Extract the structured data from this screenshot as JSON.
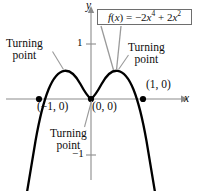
{
  "figure": {
    "background_color": "#ffffff",
    "curve_color": "#000000",
    "axis_color": "#8c8c8c",
    "leader_color": "#9a9a9a",
    "text_color": "#0d0d0d"
  },
  "formula": {
    "label": "f(x) = −2x⁴ + 2x²",
    "function_name": "f",
    "variable": "x",
    "expression": "−2x^4 + 2x^2"
  },
  "axes": {
    "x_label": "x",
    "y_label": "y",
    "x_ticks": [],
    "y_ticks": [
      {
        "label": "1",
        "value": 1
      },
      {
        "label": "−1",
        "value": -1
      }
    ]
  },
  "annotations": [
    {
      "name": "turning-point-left",
      "line1": "Turning",
      "line2": "point"
    },
    {
      "name": "turning-point-right",
      "line1": "Turning",
      "line2": "point"
    },
    {
      "name": "turning-point-bottom",
      "line1": "Turning",
      "line2": "point"
    }
  ],
  "points": [
    {
      "name": "x-intercept-negative-one",
      "label": "(−1, 0)",
      "x": -1,
      "y": 0
    },
    {
      "name": "origin-intercept",
      "label": "(0, 0)",
      "x": 0,
      "y": 0
    },
    {
      "name": "x-intercept-one",
      "label": "(1, 0)",
      "x": 1,
      "y": 0
    }
  ],
  "chart_data": {
    "type": "line",
    "title": "",
    "xlabel": "x",
    "ylabel": "y",
    "function": "f(x) = -2x^4 + 2x^2",
    "grid": false,
    "legend": "none",
    "xlim": [
      -1.23,
      1.23
    ],
    "ylim": [
      -1.78,
      0.85
    ],
    "x_ticks": [],
    "y_ticks": [
      1,
      -1
    ],
    "y_tick_labels": [
      "1",
      "-1"
    ],
    "roots": [
      -1,
      0,
      1
    ],
    "turning_points": [
      {
        "x": -0.7071,
        "y": 0.5,
        "type": "maximum"
      },
      {
        "x": 0,
        "y": 0,
        "type": "minimum"
      },
      {
        "x": 0.7071,
        "y": 0.5,
        "type": "maximum"
      }
    ],
    "x": [
      -1.23,
      -1.18,
      -1.13,
      -1.08,
      -1.03,
      -0.98,
      -0.93,
      -0.88,
      -0.83,
      -0.78,
      -0.73,
      -0.68,
      -0.63,
      -0.58,
      -0.53,
      -0.48,
      -0.43,
      -0.38,
      -0.33,
      -0.28,
      -0.23,
      -0.18,
      -0.13,
      -0.08,
      -0.03,
      0.03,
      0.08,
      0.13,
      0.18,
      0.23,
      0.28,
      0.33,
      0.38,
      0.43,
      0.48,
      0.53,
      0.58,
      0.63,
      0.68,
      0.73,
      0.78,
      0.83,
      0.88,
      0.93,
      0.98,
      1.03,
      1.08,
      1.13,
      1.18,
      1.23
    ],
    "y": [
      -1.55,
      -1.09,
      -0.71,
      -0.39,
      -0.13,
      0.07,
      0.23,
      0.33,
      0.4,
      0.44,
      0.5,
      0.49,
      0.48,
      0.45,
      0.4,
      0.33,
      0.26,
      0.18,
      0.11,
      0.05,
      0.03,
      0.01,
      0.0,
      0.0,
      0.0,
      0.0,
      0.0,
      0.0,
      0.01,
      0.03,
      0.05,
      0.11,
      0.18,
      0.26,
      0.33,
      0.4,
      0.45,
      0.48,
      0.49,
      0.5,
      0.44,
      0.4,
      0.33,
      0.23,
      0.07,
      -0.13,
      -0.39,
      -0.71,
      -1.09,
      -1.55
    ],
    "annotations": [
      {
        "text": "Turning point",
        "target_x": -0.7071,
        "target_y": 0.5
      },
      {
        "text": "Turning point",
        "target_x": 0.7071,
        "target_y": 0.5
      },
      {
        "text": "Turning point",
        "target_x": 0,
        "target_y": 0
      },
      {
        "text": "(-1, 0)",
        "target_x": -1,
        "target_y": 0
      },
      {
        "text": "(0, 0)",
        "target_x": 0,
        "target_y": 0
      },
      {
        "text": "(1, 0)",
        "target_x": 1,
        "target_y": 0
      },
      {
        "text": "f(x) = -2x^4 + 2x^2",
        "target_x": 0.5,
        "target_y": 0.45
      }
    ]
  }
}
